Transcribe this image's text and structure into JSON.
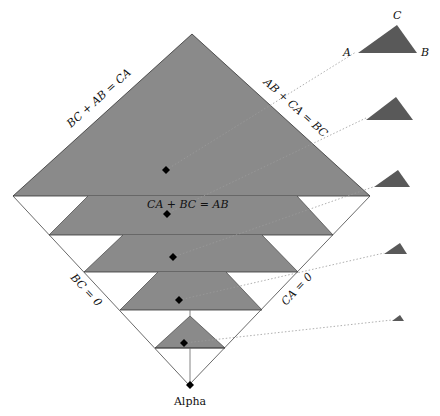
{
  "diagram": {
    "edge_labels": {
      "top_left": "BC + AB = CA",
      "top_right": "AB + CA = BC",
      "middle": "CA + BC = AB",
      "lower_left": "BC = 0",
      "lower_right": "CA = 0"
    },
    "bottom_label": "Alpha",
    "triangle_vertex_labels": {
      "a": "A",
      "b": "B",
      "c": "C"
    },
    "colors": {
      "region_fill": "#8a8a8a",
      "small_triangle_fill": "#595959",
      "line": "#333333",
      "dotted_connector": "#9a9a9a",
      "point": "#000000"
    },
    "bands": [
      {
        "name": "top-triangle",
        "point": [
          166,
          170
        ]
      },
      {
        "name": "band-1",
        "point": [
          167,
          214
        ]
      },
      {
        "name": "band-2",
        "point": [
          173,
          257
        ]
      },
      {
        "name": "band-3",
        "point": [
          179,
          300
        ]
      },
      {
        "name": "band-4",
        "point": [
          184,
          343
        ]
      }
    ],
    "shape_examples": [
      {
        "name": "shape-1",
        "size": "large"
      },
      {
        "name": "shape-2",
        "size": "medium"
      },
      {
        "name": "shape-3",
        "size": "medium-small"
      },
      {
        "name": "shape-4",
        "size": "small"
      },
      {
        "name": "shape-5",
        "size": "tiny"
      }
    ]
  }
}
